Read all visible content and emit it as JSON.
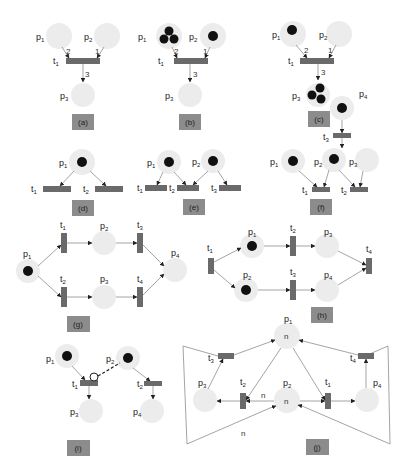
{
  "figure": {
    "panels": [
      {
        "id": "a",
        "caption": "(a)",
        "places": [
          "p1",
          "p2",
          "p3"
        ],
        "transitions": [
          "t1"
        ],
        "weights": [
          "2",
          "1",
          "3"
        ],
        "tokens": {
          "p1": 0,
          "p2": 0,
          "p3": 0
        }
      },
      {
        "id": "b",
        "caption": "(b)",
        "places": [
          "p1",
          "p2",
          "p3"
        ],
        "transitions": [
          "t1"
        ],
        "weights": [
          "2",
          "1",
          "3"
        ],
        "tokens": {
          "p1": 3,
          "p2": 1,
          "p3": 0
        }
      },
      {
        "id": "c",
        "caption": "(c)",
        "places": [
          "p1",
          "p2",
          "p3"
        ],
        "transitions": [
          "t1"
        ],
        "weights": [
          "2",
          "1",
          "3"
        ],
        "tokens": {
          "p1": 1,
          "p2": 0,
          "p3": 3
        }
      },
      {
        "id": "d",
        "caption": "(d)",
        "places": [
          "p1"
        ],
        "transitions": [
          "t1",
          "t2"
        ],
        "tokens": {
          "p1": 1
        }
      },
      {
        "id": "e",
        "caption": "(e)",
        "places": [
          "p1",
          "p2"
        ],
        "transitions": [
          "t1",
          "t2",
          "t3"
        ],
        "tokens": {
          "p1": 1,
          "p2": 1
        }
      },
      {
        "id": "f",
        "caption": "(f)",
        "places": [
          "p1",
          "p2",
          "p3",
          "p4"
        ],
        "transitions": [
          "t1",
          "t2",
          "t3"
        ],
        "tokens": {
          "p1": 1,
          "p2": 1,
          "p3": 0,
          "p4": 1
        }
      },
      {
        "id": "g",
        "caption": "(g)",
        "places": [
          "p1",
          "p2",
          "p3",
          "p4"
        ],
        "transitions": [
          "t1",
          "t2",
          "t3",
          "t4"
        ],
        "tokens": {
          "p1": 1
        }
      },
      {
        "id": "h",
        "caption": "(h)",
        "places": [
          "p1",
          "p2",
          "p3",
          "p4"
        ],
        "transitions": [
          "t1",
          "t2",
          "t3",
          "t4"
        ],
        "tokens": {
          "p1": 1,
          "p2": 1
        }
      },
      {
        "id": "i",
        "caption": "(i)",
        "places": [
          "p1",
          "p2",
          "p3",
          "p4"
        ],
        "transitions": [
          "t1",
          "t2"
        ],
        "tokens": {
          "p1": 1,
          "p2": 1
        },
        "inhibitor_arc": "p2-t1"
      },
      {
        "id": "j",
        "caption": "(j)",
        "places": [
          "p1",
          "p2",
          "p3",
          "p4"
        ],
        "transitions": [
          "t1",
          "t2",
          "t3",
          "t4"
        ],
        "place_marking": {
          "p1": "n",
          "p2": "n"
        },
        "weights": [
          "n",
          "n"
        ]
      }
    ]
  },
  "labels": {
    "p": "p",
    "t": "t",
    "n": "n",
    "s1": "1",
    "s2": "2",
    "s3": "3",
    "s4": "4",
    "w2": "2",
    "w1": "1",
    "w3": "3",
    "ca": "(a)",
    "cb": "(b)",
    "cc": "(c)",
    "cd": "(d)",
    "ce": "(e)",
    "cf": "(f)",
    "cg": "(g)",
    "ch": "(h)",
    "ci": "(i)",
    "cj": "(j)"
  }
}
